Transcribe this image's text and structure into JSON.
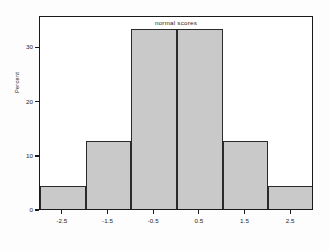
{
  "chart_data": {
    "type": "bar",
    "title": "",
    "subtitle": "",
    "xlabel": "normal scores",
    "ylabel": "Percent",
    "categories": [
      "-2.5",
      "-1.5",
      "-0.5",
      "0.5",
      "1.5",
      "2.5"
    ],
    "values": [
      4.2,
      12.5,
      33.3,
      33.3,
      12.5,
      4.2
    ],
    "bin_edges": [
      -3.0,
      -2.0,
      -1.0,
      0.0,
      1.0,
      2.0,
      3.0
    ],
    "bin_width": 1.0,
    "xlim": [
      -3.0,
      3.0
    ],
    "ylim": [
      0,
      35.8
    ],
    "xticks": [
      "-2.5",
      "-1.5",
      "-0.5",
      "0.5",
      "1.5",
      "2.5"
    ],
    "xtick_values": [
      -2.5,
      -1.5,
      -0.5,
      0.5,
      1.5,
      2.5
    ],
    "yticks": [
      "0",
      "10",
      "20",
      "30"
    ],
    "ytick_values": [
      0,
      10,
      20,
      30
    ],
    "grid": false,
    "legend": null,
    "legend_position": "none",
    "bar_fill_color": "#c9c9c9",
    "bar_edge_color": "#2a2a2a",
    "frame_color": "#1a1a1a",
    "background_color": "#ffffff"
  },
  "axes": {
    "y_title": "Percent",
    "x_title": "normal scores"
  }
}
